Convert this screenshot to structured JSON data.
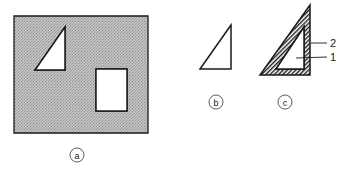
{
  "figure": {
    "panels": [
      {
        "id": "a",
        "caption": "a",
        "description": "grey stippled rectangular plate with a triangular hole and a rectangular hole"
      },
      {
        "id": "b",
        "caption": "b",
        "description": "right triangle outline"
      },
      {
        "id": "c",
        "caption": "c",
        "description": "triangle with hatched border band and inner triangle"
      }
    ],
    "callouts": [
      {
        "label": "2"
      },
      {
        "label": "1"
      }
    ],
    "colors": {
      "stipple_fill": "#b9b9b9",
      "line": "#1a1a1a",
      "background": "#ffffff"
    }
  }
}
